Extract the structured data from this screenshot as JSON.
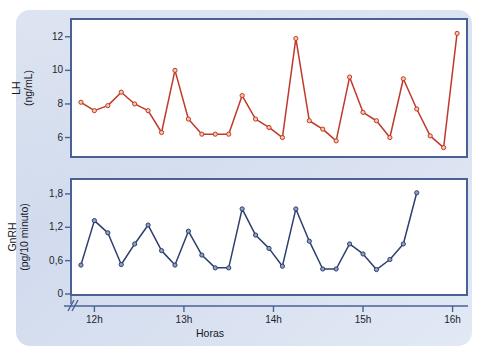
{
  "figure": {
    "panels": [
      {
        "id": "lh",
        "ylabel_line1": "LH",
        "ylabel_line2": "(ng/mL)",
        "yticks": [
          "6",
          "8",
          "10",
          "12"
        ],
        "series_color": "#c0392b",
        "marker_fill": "#f6c9a0"
      },
      {
        "id": "gnrh",
        "ylabel_line1": "GnRH",
        "ylabel_line2": "(pg/10 minuto)",
        "yticks": [
          "0",
          "0,6",
          "1,2",
          "1,8"
        ],
        "series_color": "#2e3f6e",
        "marker_fill": "#8fa0c4"
      }
    ],
    "xticks": [
      "12h",
      "13h",
      "14h",
      "15h",
      "16h"
    ],
    "xlabel": "Horas",
    "axis_break_symbol": "//"
  },
  "chart_data": [
    {
      "type": "line",
      "title": "",
      "xlabel": "Horas",
      "ylabel": "LH (ng/mL)",
      "xlim": [
        11.75,
        16.15
      ],
      "ylim": [
        4.9,
        13.0
      ],
      "yticks": [
        6,
        8,
        10,
        12
      ],
      "xticks": [
        12,
        13,
        14,
        15,
        16
      ],
      "xticklabels": [
        "12h",
        "13h",
        "14h",
        "15h",
        "16h"
      ],
      "grid": false,
      "legend": null,
      "color": "#c0392b",
      "marker": "circle",
      "x": [
        11.85,
        12.0,
        12.15,
        12.3,
        12.45,
        12.6,
        12.75,
        12.9,
        13.05,
        13.2,
        13.35,
        13.5,
        13.65,
        13.8,
        13.95,
        14.1,
        14.25,
        14.4,
        14.55,
        14.7,
        14.85,
        15.0,
        15.15,
        15.3,
        15.45,
        15.6,
        15.75,
        15.9,
        16.05
      ],
      "y": [
        8.1,
        7.6,
        7.9,
        8.7,
        8.0,
        7.6,
        6.3,
        10.0,
        7.1,
        6.2,
        6.2,
        6.2,
        8.5,
        7.1,
        6.6,
        6.0,
        11.9,
        7.0,
        6.5,
        5.8,
        9.6,
        7.5,
        7.0,
        6.0,
        9.5,
        7.7,
        6.1,
        5.4,
        12.2
      ]
    },
    {
      "type": "line",
      "title": "",
      "xlabel": "Horas",
      "ylabel": "GnRH (pg/10 minuto)",
      "xlim": [
        11.75,
        16.15
      ],
      "ylim": [
        0,
        2.05
      ],
      "yticks": [
        0,
        0.6,
        1.2,
        1.8
      ],
      "yticklabels": [
        "0",
        "0,6",
        "1,2",
        "1,8"
      ],
      "xticks": [
        12,
        13,
        14,
        15,
        16
      ],
      "xticklabels": [
        "12h",
        "13h",
        "14h",
        "15h",
        "16h"
      ],
      "grid": false,
      "legend": null,
      "color": "#2e3f6e",
      "marker": "circle",
      "x": [
        11.85,
        12.0,
        12.15,
        12.3,
        12.45,
        12.6,
        12.75,
        12.9,
        13.05,
        13.2,
        13.35,
        13.5,
        13.65,
        13.8,
        13.95,
        14.1,
        14.25,
        14.4,
        14.55,
        14.7,
        14.85,
        15.0,
        15.15,
        15.3,
        15.45,
        15.6,
        15.75,
        15.9
      ],
      "y": [
        0.52,
        1.32,
        1.1,
        0.53,
        0.9,
        1.24,
        0.78,
        0.52,
        1.13,
        0.7,
        0.47,
        0.47,
        1.53,
        1.06,
        0.82,
        0.5,
        1.53,
        0.95,
        0.45,
        0.45,
        0.9,
        0.72,
        0.44,
        0.62,
        0.9,
        1.82
      ]
    }
  ]
}
